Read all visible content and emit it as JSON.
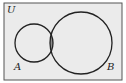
{
  "diagram": {
    "type": "venn",
    "universe_label": "U",
    "sets": [
      {
        "name": "A",
        "label": "A"
      },
      {
        "name": "B",
        "label": "B"
      }
    ],
    "shaded_region": "A ∩ B",
    "colors": {
      "background": "#ebebeb",
      "stroke": "#222222",
      "shade": "#8a8a8a"
    }
  }
}
